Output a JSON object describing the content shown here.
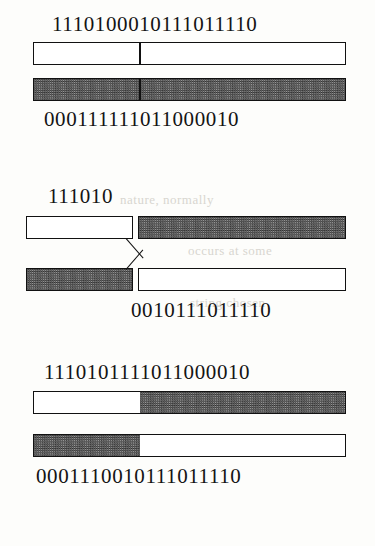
{
  "figure": {
    "type": "genetic-algorithm-single-point-crossover-diagram",
    "panels": [
      {
        "id": "parents",
        "top_label": "1110100010111011110",
        "bottom_label": "000111111011000010",
        "bars": [
          {
            "name": "parent-1-chromosome",
            "segments": [
              {
                "fill": "white",
                "width_pct": 34
              },
              {
                "fill": "white",
                "width_pct": 66
              }
            ],
            "divider_after_first": true
          },
          {
            "name": "parent-2-chromosome",
            "segments": [
              {
                "fill": "shaded",
                "width_pct": 34
              },
              {
                "fill": "shaded",
                "width_pct": 66
              }
            ],
            "divider_after_first": true
          }
        ]
      },
      {
        "id": "crossover",
        "top_label": "111010",
        "bottom_label": "0010111011110",
        "bars": [
          {
            "name": "parent-1-head",
            "fill": "white"
          },
          {
            "name": "parent-2-tail",
            "fill": "shaded"
          },
          {
            "name": "parent-2-head",
            "fill": "shaded"
          },
          {
            "name": "parent-1-tail",
            "fill": "white"
          }
        ]
      },
      {
        "id": "offspring",
        "top_label": "1110101111011000010",
        "bottom_label": "0001110010111011110",
        "bars": [
          {
            "name": "offspring-1-chromosome",
            "segments": [
              {
                "fill": "white",
                "width_pct": 34
              },
              {
                "fill": "shaded",
                "width_pct": 66
              }
            ],
            "divider_after_first": false
          },
          {
            "name": "offspring-2-chromosome",
            "segments": [
              {
                "fill": "shaded",
                "width_pct": 34
              },
              {
                "fill": "white",
                "width_pct": 66
              }
            ],
            "divider_after_first": false
          }
        ]
      }
    ],
    "colors": {
      "ink": "#141414",
      "paper": "#fdfdfb",
      "shaded_fill": "#9b9b9b",
      "white_fill": "#ffffff",
      "ghost_text": "#d8d6d0"
    }
  },
  "ghost_text": {
    "line_1": "nature, normally",
    "line_2": "occurs at some",
    "line_3": "point of the binary",
    "line_4": "string chosen"
  }
}
